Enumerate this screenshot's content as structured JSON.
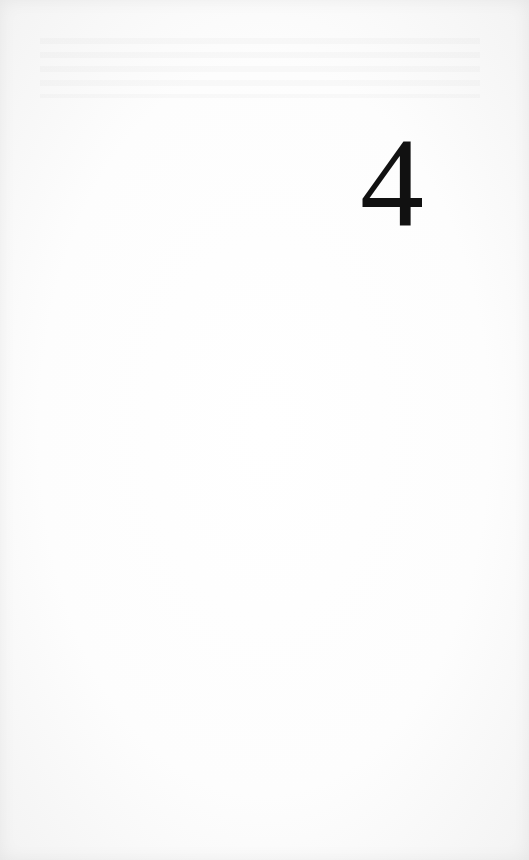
{
  "page": {
    "chapter_number": "4"
  }
}
